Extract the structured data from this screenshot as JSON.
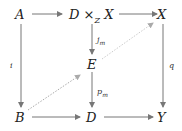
{
  "diagram": {
    "type": "commutative-diagram",
    "nodes": {
      "A": "A",
      "DxZX": "D ×",
      "DxZX_sub": "Z",
      "DxZX_tail": " X",
      "X": "X",
      "E": "E",
      "B": "B",
      "D": "D",
      "Y": "Y"
    },
    "labels": {
      "i": "i",
      "q": "q",
      "j_m": "j",
      "j_m_sub": "m",
      "p_m": "p",
      "p_m_sub": "m"
    },
    "colors": {
      "arrow": "#777777",
      "dotted": "#aaaaaa",
      "text": "#222222"
    }
  }
}
